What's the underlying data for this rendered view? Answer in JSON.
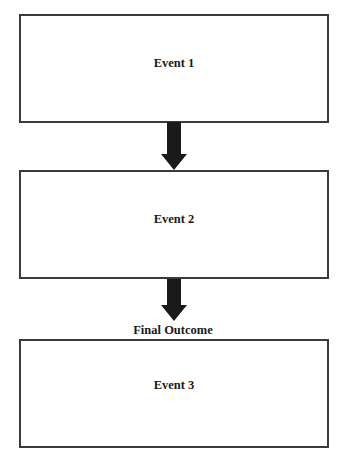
{
  "diagram": {
    "type": "flowchart",
    "direction": "top-to-bottom",
    "nodes": [
      {
        "id": "event1",
        "label": "Event 1"
      },
      {
        "id": "event2",
        "label": "Event 2"
      },
      {
        "id": "event3",
        "label": "Event 3",
        "caption": "Final Outcome"
      }
    ],
    "edges": [
      {
        "from": "event1",
        "to": "event2"
      },
      {
        "from": "event2",
        "to": "event3"
      }
    ],
    "colors": {
      "border": "#3a3a3a",
      "arrow": "#1a1a1a",
      "background": "#ffffff"
    }
  }
}
